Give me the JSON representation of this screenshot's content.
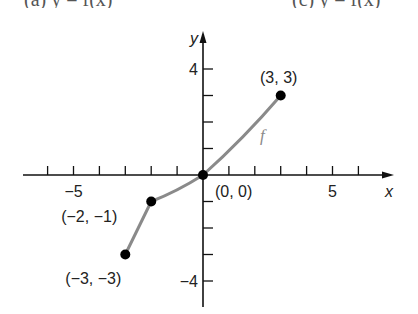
{
  "header_fragment": {
    "left_text": "(a) y = f(x)",
    "right_text": "(c) y = f(x)"
  },
  "chart_data": {
    "type": "line",
    "title": "",
    "xlabel": "x",
    "ylabel": "y",
    "xlim": [
      -7,
      7.3
    ],
    "ylim": [
      -5.1,
      5.5
    ],
    "grid": false,
    "x_ticks": [
      -6,
      -5,
      -4,
      -3,
      -2,
      -1,
      1,
      2,
      3,
      4,
      5,
      6
    ],
    "x_tick_labels": {
      "-5": "−5",
      "5": "5"
    },
    "y_ticks": [
      -4,
      -3,
      -2,
      -1,
      1,
      2,
      3,
      4
    ],
    "y_tick_labels": {
      "-4": "−4",
      "4": "4"
    },
    "series": [
      {
        "name": "f",
        "color": "#8a8a8a",
        "segments": [
          {
            "from": [
              -3,
              -3
            ],
            "to": [
              -2,
              -1
            ],
            "shape": "linear"
          },
          {
            "from": [
              -2,
              -1
            ],
            "to": [
              0,
              0
            ],
            "shape": "concave-up curve"
          },
          {
            "from": [
              0,
              0
            ],
            "to": [
              3,
              3
            ],
            "shape": "concave-down curve"
          }
        ]
      }
    ],
    "points": [
      {
        "x": -3,
        "y": -3,
        "label": "(−3, −3)"
      },
      {
        "x": -2,
        "y": -1,
        "label": "(−2, −1)"
      },
      {
        "x": 0,
        "y": 0,
        "label": "(0, 0)"
      },
      {
        "x": 3,
        "y": 3,
        "label": "(3, 3)"
      }
    ],
    "annotations": [
      {
        "text": "f",
        "x": 2.2,
        "y": 1.4,
        "style": "italic gray"
      }
    ],
    "point_color": "#000000",
    "axis_color": "#111111"
  }
}
